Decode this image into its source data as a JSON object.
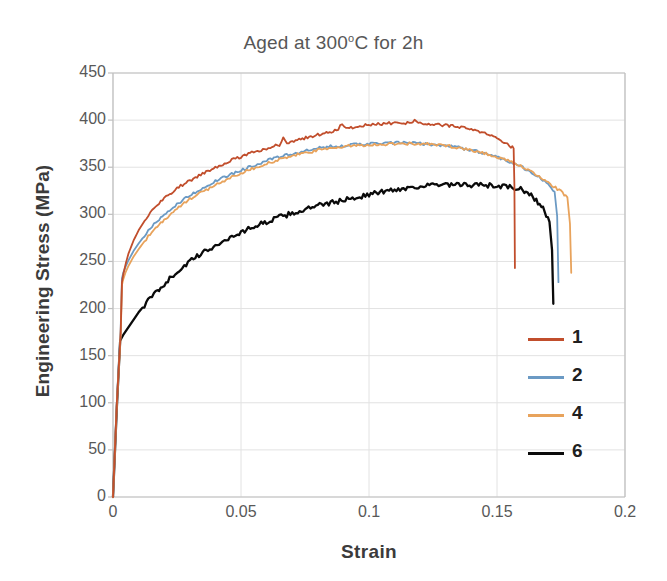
{
  "chart_data": {
    "type": "line",
    "title_prefix": "Aged at 300",
    "title_degree": "o",
    "title_suffix": "C for 2h",
    "xlabel": "Strain",
    "ylabel": "Engineering Stress (MPa)",
    "xlim": [
      0,
      0.2
    ],
    "ylim": [
      0,
      450
    ],
    "xticks": [
      0,
      0.05,
      0.1,
      0.15,
      0.2
    ],
    "xticklabels": [
      "0",
      "0.05",
      "0.1",
      "0.15",
      "0.2"
    ],
    "yticks": [
      0,
      50,
      100,
      150,
      200,
      250,
      300,
      350,
      400,
      450
    ],
    "yticklabels": [
      "0",
      "50",
      "100",
      "150",
      "200",
      "250",
      "300",
      "350",
      "400",
      "450"
    ],
    "grid": "horizontal-and-vertical-light",
    "legend_position": "inside-right",
    "series": [
      {
        "name": "1",
        "color": "#C14E2C",
        "x": [
          0,
          0.0015,
          0.003,
          0.0035,
          0.004,
          0.005,
          0.006,
          0.008,
          0.01,
          0.013,
          0.016,
          0.02,
          0.025,
          0.03,
          0.035,
          0.04,
          0.045,
          0.05,
          0.055,
          0.06,
          0.065,
          0.0665,
          0.068,
          0.072,
          0.078,
          0.084,
          0.088,
          0.0895,
          0.091,
          0.095,
          0.1,
          0.105,
          0.11,
          0.115,
          0.1185,
          0.12,
          0.124,
          0.128,
          0.132,
          0.136,
          0.14,
          0.144,
          0.148,
          0.152,
          0.1555,
          0.1565,
          0.1568,
          0.157
        ],
        "y": [
          0,
          100,
          175,
          228,
          236,
          248,
          258,
          272,
          283,
          296,
          306,
          317,
          328,
          336,
          343,
          350,
          356,
          361,
          366,
          370,
          374,
          381,
          376,
          379,
          383,
          387,
          390,
          397,
          391,
          393,
          395,
          396,
          397,
          397,
          400,
          396,
          396,
          395,
          394,
          392,
          390,
          387,
          383,
          378,
          372,
          370,
          330,
          243
        ]
      },
      {
        "name": "2",
        "color": "#6B9AC4",
        "x": [
          0,
          0.0015,
          0.003,
          0.0035,
          0.004,
          0.005,
          0.006,
          0.008,
          0.01,
          0.013,
          0.016,
          0.02,
          0.025,
          0.03,
          0.035,
          0.04,
          0.045,
          0.05,
          0.055,
          0.06,
          0.065,
          0.07,
          0.075,
          0.08,
          0.085,
          0.09,
          0.095,
          0.1,
          0.105,
          0.11,
          0.115,
          0.12,
          0.125,
          0.13,
          0.135,
          0.14,
          0.145,
          0.15,
          0.155,
          0.16,
          0.165,
          0.17,
          0.1725,
          0.1735,
          0.174
        ],
        "y": [
          0,
          100,
          178,
          232,
          238,
          245,
          251,
          261,
          269,
          280,
          289,
          299,
          311,
          320,
          328,
          335,
          341,
          347,
          352,
          357,
          361,
          364,
          367,
          370,
          372,
          373,
          374,
          375,
          375,
          376,
          376,
          375,
          374,
          373,
          371,
          368,
          365,
          361,
          356,
          350,
          342,
          332,
          324,
          298,
          228
        ]
      },
      {
        "name": "4",
        "color": "#E8A35C",
        "x": [
          0,
          0.0015,
          0.003,
          0.0035,
          0.004,
          0.005,
          0.006,
          0.008,
          0.01,
          0.013,
          0.016,
          0.02,
          0.025,
          0.03,
          0.035,
          0.04,
          0.045,
          0.05,
          0.055,
          0.06,
          0.065,
          0.07,
          0.075,
          0.08,
          0.085,
          0.09,
          0.095,
          0.1,
          0.105,
          0.11,
          0.115,
          0.12,
          0.125,
          0.13,
          0.135,
          0.14,
          0.145,
          0.15,
          0.155,
          0.16,
          0.165,
          0.17,
          0.175,
          0.1775,
          0.1785,
          0.179
        ],
        "y": [
          0,
          98,
          172,
          225,
          231,
          239,
          245,
          255,
          263,
          274,
          283,
          294,
          306,
          316,
          324,
          331,
          338,
          344,
          349,
          354,
          358,
          362,
          365,
          368,
          370,
          372,
          373,
          374,
          374,
          375,
          375,
          375,
          374,
          373,
          371,
          368,
          365,
          361,
          356,
          350,
          343,
          334,
          324,
          318,
          290,
          238
        ]
      },
      {
        "name": "6",
        "color": "#0A0A0A",
        "x": [
          0,
          0.0015,
          0.0028,
          0.004,
          0.006,
          0.008,
          0.01,
          0.013,
          0.016,
          0.02,
          0.025,
          0.03,
          0.035,
          0.04,
          0.045,
          0.05,
          0.055,
          0.06,
          0.065,
          0.07,
          0.075,
          0.08,
          0.085,
          0.09,
          0.095,
          0.1,
          0.105,
          0.11,
          0.115,
          0.12,
          0.125,
          0.13,
          0.135,
          0.14,
          0.145,
          0.15,
          0.155,
          0.16,
          0.164,
          0.168,
          0.1705,
          0.1715,
          0.172
        ],
        "y": [
          0,
          95,
          166,
          172,
          180,
          188,
          196,
          206,
          215,
          226,
          239,
          250,
          259,
          267,
          274,
          281,
          287,
          292,
          297,
          301,
          305,
          309,
          312,
          315,
          318,
          321,
          324,
          326,
          328,
          330,
          331,
          331,
          331,
          331,
          331,
          330,
          329,
          326,
          319,
          306,
          292,
          262,
          205
        ]
      }
    ],
    "legend_entries": [
      {
        "label": "1",
        "color": "#C14E2C"
      },
      {
        "label": "2",
        "color": "#6B9AC4"
      },
      {
        "label": "4",
        "color": "#E8A35C"
      },
      {
        "label": "6",
        "color": "#0A0A0A"
      }
    ],
    "annotations": []
  },
  "plot_geometry": {
    "left": 113,
    "right": 625,
    "top": 73,
    "bottom": 497
  },
  "colors": {
    "grid": "#E2E2E2",
    "axis": "#BFBFBF",
    "tick_text": "#585858",
    "title_text": "#575757",
    "axis_title_text": "#3b3b3b",
    "background": "#ffffff"
  }
}
